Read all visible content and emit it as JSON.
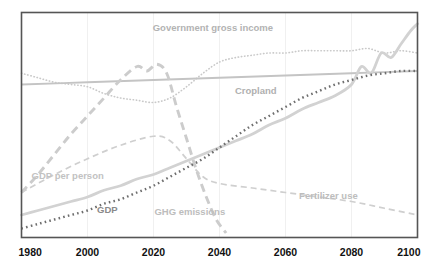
{
  "chart_data": {
    "type": "line",
    "title": "",
    "xlabel": "",
    "ylabel": "",
    "xlim": [
      1980,
      2100
    ],
    "ylim": [
      0,
      100
    ],
    "grid": "vertical-faint",
    "legend_position": "inline-labels",
    "xticks": [
      "1980",
      "2000",
      "2020",
      "2040",
      "2060",
      "2080",
      "2100"
    ],
    "xtick_values": [
      1980,
      2000,
      2020,
      2040,
      2060,
      2080,
      2100
    ],
    "series": [
      {
        "name": "Government gross income",
        "label": "Government gross income",
        "style": "dotted",
        "color": "#c9c9c9",
        "label_color": "#b3b3b3",
        "x": [
          1980,
          1985,
          1990,
          1995,
          2000,
          2005,
          2010,
          2015,
          2020,
          2025,
          2030,
          2035,
          2040,
          2045,
          2050,
          2055,
          2060,
          2065,
          2070,
          2075,
          2080,
          2085,
          2090,
          2095,
          2100
        ],
        "values": [
          73,
          71,
          69,
          68,
          67,
          64,
          62,
          61,
          60,
          62,
          67,
          73,
          78,
          80,
          81,
          82,
          82,
          83,
          83,
          83,
          83,
          84,
          82,
          83,
          82
        ]
      },
      {
        "name": "Cropland",
        "label": "Cropland",
        "style": "solid",
        "color": "#c4c4c4",
        "label_color": "#b0b0b0",
        "x": [
          1980,
          2000,
          2020,
          2040,
          2060,
          2080,
          2100
        ],
        "values": [
          68,
          69,
          70,
          71,
          72,
          73,
          74
        ]
      },
      {
        "name": "GHG emissions",
        "label": "GHG emissions",
        "style": "dashed-thick",
        "color": "#cccccc",
        "label_color": "#bdbdbd",
        "x": [
          1980,
          1985,
          1990,
          1995,
          2000,
          2005,
          2010,
          2015,
          2018,
          2021,
          2024,
          2027,
          2030,
          2033,
          2036,
          2039,
          2042
        ],
        "values": [
          20,
          28,
          37,
          46,
          54,
          62,
          70,
          76,
          74,
          77,
          73,
          58,
          44,
          30,
          18,
          8,
          2
        ]
      },
      {
        "name": "Fertilizer use",
        "label": "Fertilizer use",
        "style": "dashed",
        "color": "#cfcfcf",
        "label_color": "#bdbdbd",
        "x": [
          1980,
          1990,
          2000,
          2010,
          2020,
          2025,
          2030,
          2035,
          2040,
          2050,
          2060,
          2070,
          2080,
          2090,
          2100
        ],
        "values": [
          20,
          28,
          35,
          41,
          45,
          43,
          35,
          27,
          24,
          22,
          20,
          18,
          16,
          13,
          10
        ]
      },
      {
        "name": "GDP per person",
        "label": "GDP per person",
        "style": "solid-thick",
        "color": "#d2d2d2",
        "label_color": "#c2c2c2",
        "x": [
          1980,
          1985,
          1990,
          1995,
          2000,
          2005,
          2010,
          2015,
          2020,
          2025,
          2030,
          2035,
          2040,
          2045,
          2050,
          2055,
          2060,
          2065,
          2070,
          2075,
          2080,
          2083,
          2086,
          2089,
          2092,
          2095,
          2098,
          2100
        ],
        "values": [
          10,
          12,
          14,
          16,
          18,
          21,
          23,
          26,
          28,
          31,
          34,
          37,
          40,
          43,
          46,
          50,
          53,
          57,
          60,
          63,
          68,
          76,
          73,
          82,
          80,
          86,
          92,
          95
        ]
      },
      {
        "name": "GDP",
        "label": "GDP",
        "style": "square-dotted",
        "color": "#6e6e6e",
        "label_color": "#8a8a8a",
        "x": [
          1980,
          1985,
          1990,
          1995,
          2000,
          2005,
          2010,
          2015,
          2020,
          2025,
          2030,
          2035,
          2040,
          2045,
          2050,
          2055,
          2060,
          2065,
          2070,
          2075,
          2080,
          2085,
          2090,
          2095,
          2100
        ],
        "values": [
          4,
          6,
          8,
          10,
          12,
          15,
          17,
          20,
          23,
          27,
          31,
          35,
          40,
          45,
          50,
          54,
          58,
          62,
          65,
          68,
          70,
          72,
          73,
          74,
          74
        ]
      }
    ],
    "annotations": [
      {
        "text": "Government gross income",
        "x": 2038,
        "y": 92
      },
      {
        "text": "Cropland",
        "x": 2051,
        "y": 64
      },
      {
        "text": "GDP per person",
        "x": 1994,
        "y": 26
      },
      {
        "text": "GDP",
        "x": 2006,
        "y": 11
      },
      {
        "text": "GHG emissions",
        "x": 2031,
        "y": 10
      },
      {
        "text": "Fertilizer use",
        "x": 2073,
        "y": 17
      }
    ]
  },
  "frame": {
    "border_color": "#555555",
    "gridline_color": "#f0f0f0",
    "background": "#ffffff"
  }
}
